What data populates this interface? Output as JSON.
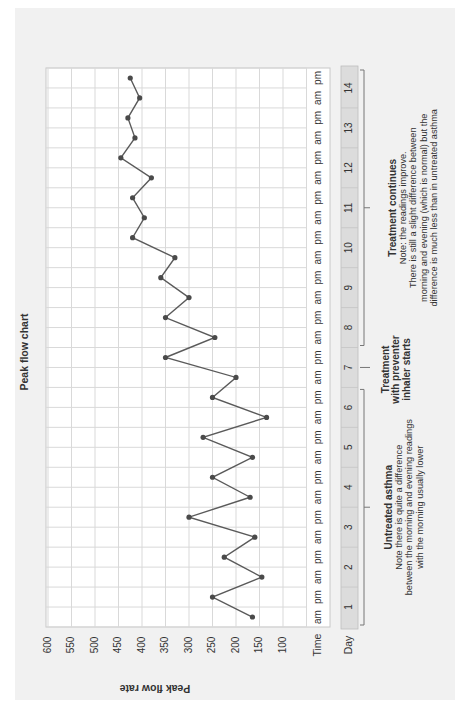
{
  "chart_data": {
    "type": "line",
    "title": "Peak flow chart",
    "xlabel": "Time / Day",
    "ylabel": "Peak flow rate",
    "ylim": [
      50,
      600
    ],
    "yticks": [
      600,
      550,
      500,
      450,
      400,
      350,
      300,
      250,
      200,
      150,
      100
    ],
    "grid": true,
    "orientation": "rotated 90° counter-clockwise (time axis vertical, day 1 at bottom)",
    "time_row_label": "Time",
    "day_row_label": "Day",
    "categories": [
      "1 am",
      "1 pm",
      "2 am",
      "2 pm",
      "3 am",
      "3 pm",
      "4 am",
      "4 pm",
      "5 am",
      "5 pm",
      "6 am",
      "6 pm",
      "7 am",
      "7 pm",
      "8 am",
      "8 pm",
      "9 am",
      "9 pm",
      "10 am",
      "10 pm",
      "11 am",
      "11 pm",
      "12 am",
      "12 pm",
      "13 am",
      "13 pm",
      "14 am",
      "14 pm"
    ],
    "days": [
      "1",
      "2",
      "3",
      "4",
      "5",
      "6",
      "7",
      "8",
      "9",
      "10",
      "11",
      "12",
      "13",
      "14"
    ],
    "time_labels": [
      "am",
      "pm"
    ],
    "series": [
      {
        "name": "Peak flow rate",
        "values": [
          165,
          250,
          145,
          225,
          160,
          300,
          170,
          250,
          165,
          270,
          135,
          250,
          200,
          350,
          245,
          350,
          300,
          360,
          330,
          420,
          395,
          420,
          380,
          445,
          415,
          430,
          405,
          425
        ]
      }
    ],
    "annotations": [
      {
        "days": "1-6",
        "heading": "Untreated asthma",
        "lines": [
          "Note there is quite a difference",
          "between the morning and evening readings",
          "with the morning usually lower"
        ]
      },
      {
        "days": "7",
        "heading_lines": [
          "Treatment",
          "with preventer",
          "inhaler starts"
        ]
      },
      {
        "days": "8-14",
        "heading": "Treatment continues",
        "lines": [
          "Note: the readings improve.",
          "There is still a slight difference between",
          "morning and evening (which is normal) but the",
          "difference is much less than in untreated asthma"
        ]
      }
    ]
  },
  "colors": {
    "background": "#ffffff",
    "panel": "#f1f1f1",
    "plot_bg": "#ffffff",
    "grid": "#d9d9d9",
    "line": "#5a5a5a",
    "marker": "#4a4a4a",
    "day_band": "#dcdcdc",
    "text": "#333333"
  }
}
